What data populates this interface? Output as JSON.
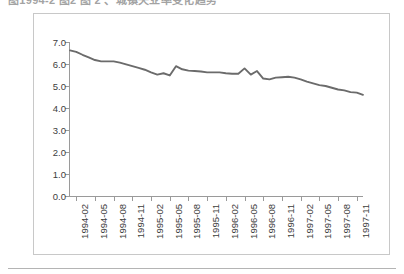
{
  "header": {
    "cut_off_caption": "图1994-2 图2 图 2 、城镇失业率变化趋势"
  },
  "figure": {
    "line_color": "#6b6b6b",
    "axis_color": "#9a9a9a",
    "frame_color": "#c8c8c8",
    "background": "#ffffff"
  },
  "chart_data": {
    "type": "line",
    "title": "",
    "subtitle": "",
    "xlabel": "",
    "ylabel": "",
    "ylim": [
      0.0,
      7.0
    ],
    "ytick_labels": [
      "0.0",
      "1.0",
      "2.0",
      "3.0",
      "4.0",
      "5.0",
      "6.0",
      "7.0"
    ],
    "ytick_values": [
      0.0,
      1.0,
      2.0,
      3.0,
      4.0,
      5.0,
      6.0,
      7.0
    ],
    "grid": false,
    "legend_position": "none",
    "xtick_labels": [
      "1994-02",
      "1994-05",
      "1994-08",
      "1994-11",
      "1995-02",
      "1995-05",
      "1995-08",
      "1995-11",
      "1996-02",
      "1996-05",
      "1996-08",
      "1996-11",
      "1997-02",
      "1997-05",
      "1997-08",
      "1997-11"
    ],
    "xtick_interval_months": 3,
    "x": [
      "1994-01",
      "1994-02",
      "1994-03",
      "1994-04",
      "1994-05",
      "1994-06",
      "1994-07",
      "1994-08",
      "1994-09",
      "1994-10",
      "1994-11",
      "1994-12",
      "1995-01",
      "1995-02",
      "1995-03",
      "1995-04",
      "1995-05",
      "1995-06",
      "1995-07",
      "1995-08",
      "1995-09",
      "1995-10",
      "1995-11",
      "1995-12",
      "1996-01",
      "1996-02",
      "1996-03",
      "1996-04",
      "1996-05",
      "1996-06",
      "1996-07",
      "1996-08",
      "1996-09",
      "1996-10",
      "1996-11",
      "1996-12",
      "1997-01",
      "1997-02",
      "1997-03",
      "1997-04",
      "1997-05",
      "1997-06",
      "1997-07",
      "1997-08",
      "1997-09",
      "1997-10",
      "1997-11",
      "1997-12"
    ],
    "series": [
      {
        "name": "rate",
        "values": [
          6.62,
          6.55,
          6.42,
          6.3,
          6.18,
          6.12,
          6.12,
          6.12,
          6.06,
          5.98,
          5.9,
          5.82,
          5.74,
          5.62,
          5.52,
          5.58,
          5.48,
          5.9,
          5.76,
          5.7,
          5.68,
          5.66,
          5.62,
          5.62,
          5.62,
          5.58,
          5.56,
          5.56,
          5.8,
          5.52,
          5.68,
          5.34,
          5.3,
          5.38,
          5.4,
          5.42,
          5.38,
          5.3,
          5.2,
          5.12,
          5.04,
          5.0,
          4.92,
          4.84,
          4.8,
          4.72,
          4.7,
          4.6
        ]
      }
    ]
  }
}
